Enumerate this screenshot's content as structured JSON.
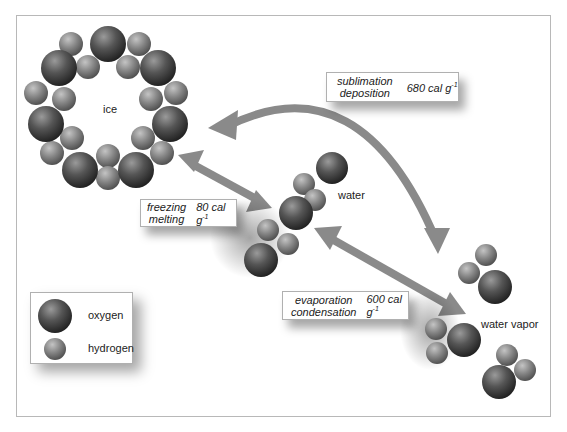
{
  "diagram": {
    "states": {
      "ice": "ice",
      "water": "water",
      "vapor": "water vapor"
    },
    "transitions": [
      {
        "names": [
          "sublimation",
          "deposition"
        ],
        "energy": "680 cal g",
        "exp": "-1"
      },
      {
        "names": [
          "freezing",
          "melting"
        ],
        "energy": "80 cal g",
        "exp": "-1"
      },
      {
        "names": [
          "evaporation",
          "condensation"
        ],
        "energy": "600 cal g",
        "exp": "-1"
      }
    ],
    "legend": {
      "oxygen": "oxygen",
      "hydrogen": "hydrogen"
    },
    "colors": {
      "arrow": "#8a8a8a",
      "oxygen_dark": "#2a2a2a",
      "hydrogen": "#7a7a7a",
      "frame": "#b8b8b8"
    }
  }
}
